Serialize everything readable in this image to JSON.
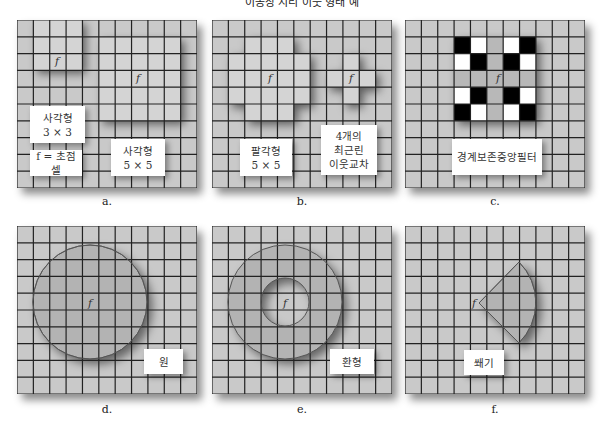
{
  "header": {
    "title": "이동창 지리 이웃 형태 예"
  },
  "panels": [
    {
      "id": "a",
      "caption": "a.",
      "labels": {
        "square3": "사각형",
        "square3_dim": "3 × 3",
        "focal": "f = 초점 셀",
        "square5": "사각형",
        "square5_dim": "5 × 5"
      }
    },
    {
      "id": "b",
      "caption": "b.",
      "labels": {
        "octagon": "팔각형",
        "octagon_dim": "5 × 5",
        "nn1": "4개의",
        "nn2": "최근린",
        "nn3": "이웃교차"
      }
    },
    {
      "id": "c",
      "caption": "c.",
      "labels": {
        "edge": "경계보존중앙필터"
      }
    },
    {
      "id": "d",
      "caption": "d.",
      "labels": {
        "circle": "원"
      }
    },
    {
      "id": "e",
      "caption": "e.",
      "labels": {
        "annulus": "환형"
      }
    },
    {
      "id": "f",
      "caption": "f.",
      "labels": {
        "wedge": "쐐기"
      }
    }
  ],
  "focal_symbol": "f",
  "grid": {
    "cols": 11,
    "rows": 10
  },
  "colors": {
    "cell": "#c8c8c8",
    "highlight": "#b4b4b4",
    "line": "#222222",
    "black": "#000000",
    "white": "#ffffff"
  }
}
